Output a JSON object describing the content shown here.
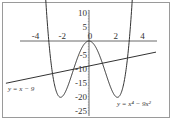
{
  "chart_data": {
    "type": "line",
    "title": "",
    "xlabel": "",
    "ylabel": "",
    "xlim": [
      -5.5,
      5.5
    ],
    "ylim": [
      -27,
      12
    ],
    "x_ticks": [
      -4,
      -2,
      0,
      2,
      4
    ],
    "x_tick_labels": [
      "-4",
      "-2",
      "0",
      "2",
      "4"
    ],
    "y_ticks": [
      10,
      5,
      -5,
      -10,
      -15,
      -20,
      -25
    ],
    "y_tick_labels": [
      "10",
      "5",
      "-5",
      "-10",
      "-15",
      "-20",
      "-25"
    ],
    "grid": false,
    "series": [
      {
        "name": "y = x^4 - 9x^2",
        "label": "y = x⁴ − 9x²",
        "function": "x^4 - 9x^2",
        "key_points": [
          {
            "x": -3,
            "y": 0
          },
          {
            "x": -2.12,
            "y": -20.25
          },
          {
            "x": 0,
            "y": 0
          },
          {
            "x": 2.12,
            "y": -20.25
          },
          {
            "x": 3,
            "y": 0
          }
        ],
        "color": "#333333"
      },
      {
        "name": "y = x - 9",
        "label": "y = x − 9",
        "function": "x - 9",
        "x_range": [
          -6.2,
          5
        ],
        "color": "#333333"
      }
    ]
  }
}
